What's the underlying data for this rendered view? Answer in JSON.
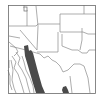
{
  "map": {
    "type": "range-map",
    "region": "Southwestern United States and northern Mexico",
    "colors": {
      "background": "#ffffff",
      "border_lines": "#8a8a8a",
      "frame": "#6a6a6a",
      "range_fill": "#4a4a4a"
    },
    "legend": [],
    "labels": []
  }
}
